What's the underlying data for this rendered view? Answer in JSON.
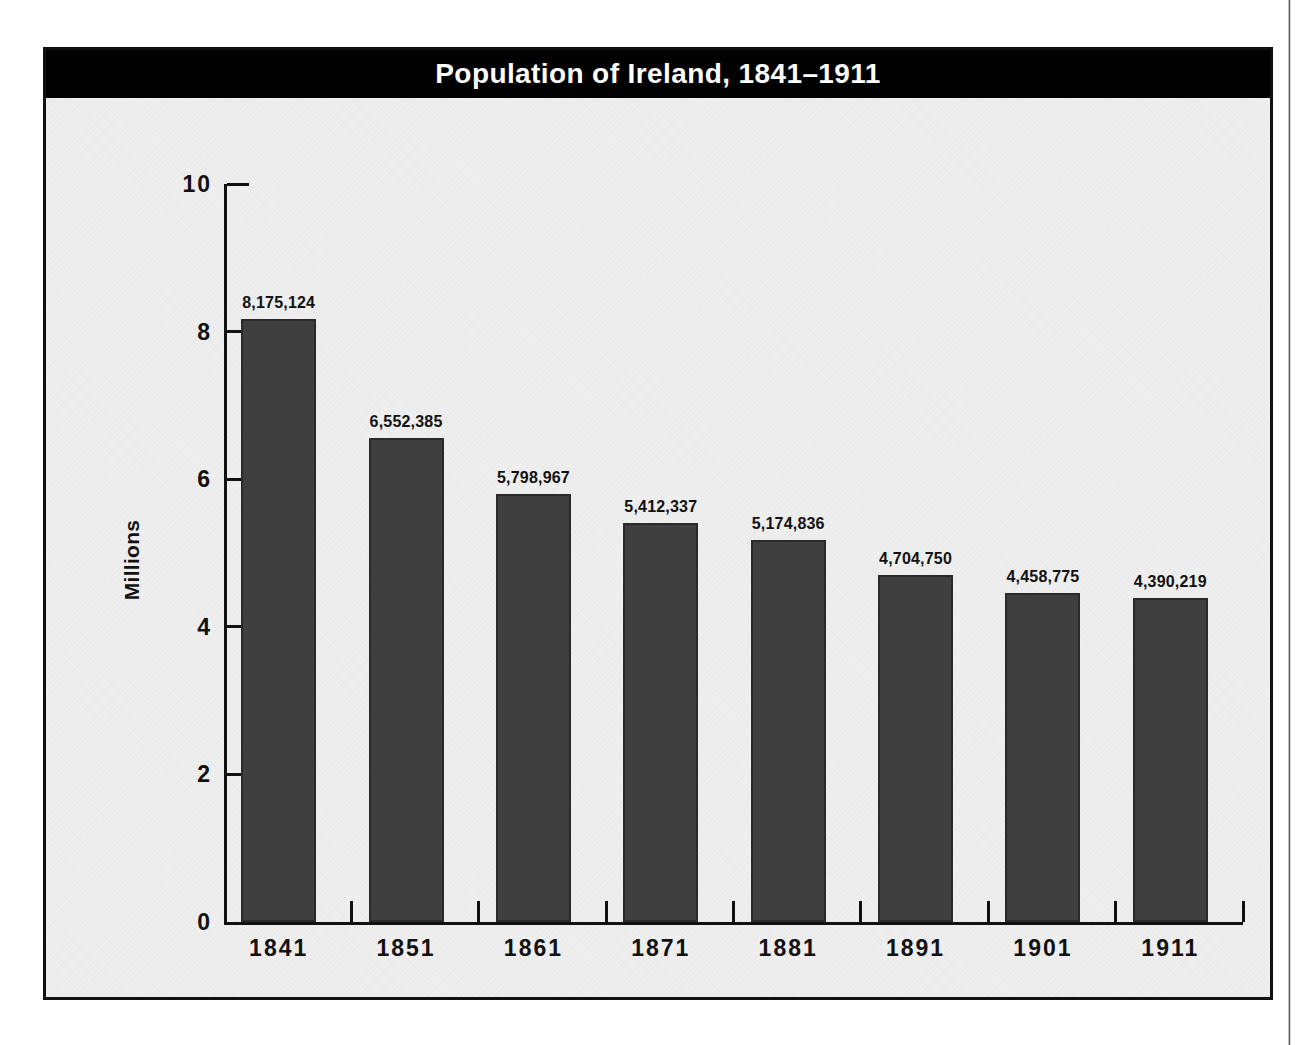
{
  "figure": {
    "title": "Population of Ireland, 1841–1911"
  },
  "chart_data": {
    "type": "bar",
    "title": "Population of Ireland, 1841–1911",
    "xlabel": "",
    "ylabel": "Millions",
    "categories": [
      "1841",
      "1851",
      "1861",
      "1871",
      "1881",
      "1891",
      "1901",
      "1911"
    ],
    "values": [
      8175124,
      6552385,
      5798967,
      5412337,
      5174836,
      4704750,
      4458775,
      4390219
    ],
    "value_labels": [
      "8,175,124",
      "6,552,385",
      "5,798,967",
      "5,412,337",
      "5,174,836",
      "4,704,750",
      "4,458,775",
      "4,390,219"
    ],
    "ylim": [
      0,
      10
    ],
    "y_ticks": [
      0,
      2,
      4,
      6,
      8,
      10
    ],
    "y_tick_labels": [
      "0",
      "2",
      "4",
      "6",
      "8",
      "10"
    ],
    "y_unit": "millions",
    "grid": false,
    "legend": false,
    "bar_color": "#3f3f3f",
    "title_background": "#000000",
    "title_color": "#ffffff",
    "plot_background": "#efefef"
  }
}
